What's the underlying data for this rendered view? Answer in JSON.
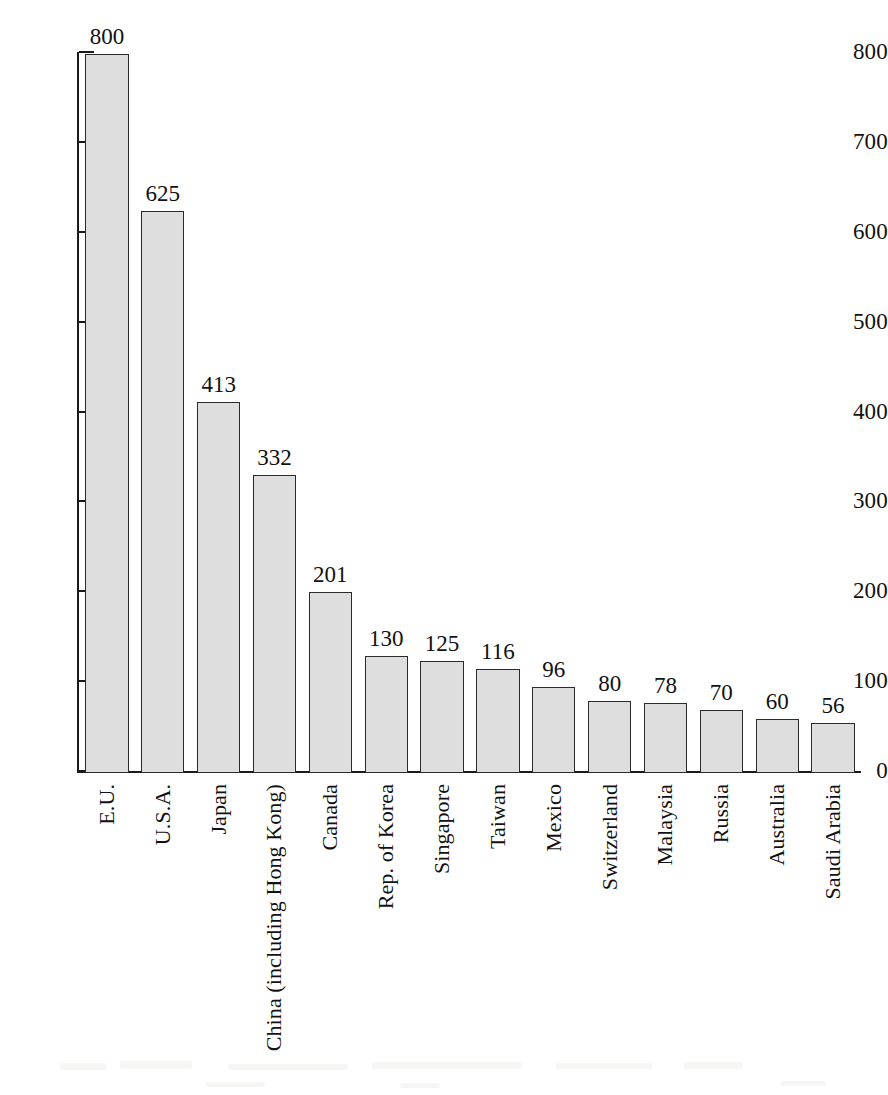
{
  "chart_data": {
    "type": "bar",
    "title": "",
    "subtitle": "",
    "xlabel": "",
    "ylabel": "",
    "ylim": [
      0,
      800
    ],
    "yticks": [
      0,
      100,
      200,
      300,
      400,
      500,
      600,
      700,
      800
    ],
    "ytick_labels": [
      "0",
      "100",
      "200",
      "300",
      "400",
      "500",
      "600",
      "700",
      "800"
    ],
    "grid": false,
    "legend": false,
    "legend_position": "none",
    "show_value_labels": true,
    "categories": [
      "E.U.",
      "U.S.A.",
      "Japan",
      "China (including Hong Kong)",
      "Canada",
      "Rep. of Korea",
      "Singapore",
      "Taiwan",
      "Mexico",
      "Switzerland",
      "Malaysia",
      "Russia",
      "Australia",
      "Saudi Arabia"
    ],
    "values": [
      800,
      625,
      413,
      332,
      201,
      130,
      125,
      116,
      96,
      80,
      78,
      70,
      60,
      56
    ],
    "value_labels": [
      "800",
      "625",
      "413",
      "332",
      "201",
      "130",
      "125",
      "116",
      "96",
      "80",
      "78",
      "70",
      "60",
      "56"
    ]
  },
  "style": {
    "bar_fill": "#dedede",
    "bar_stroke": "#2b2b2b",
    "axis_color": "#1a1a1a",
    "text_color": "#111111",
    "background": "#ffffff"
  }
}
